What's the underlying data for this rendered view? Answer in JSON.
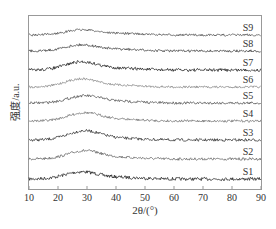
{
  "chart_data": {
    "type": "line",
    "title": "",
    "xlabel": "2θ/(°)",
    "ylabel": "强度/a.u.",
    "xlim": [
      10,
      90
    ],
    "xticks": [
      10,
      20,
      30,
      40,
      50,
      60,
      70,
      80,
      90
    ],
    "grid": false,
    "legend_position": "inline-right",
    "series": [
      {
        "name": "S1",
        "baseline_y": 179,
        "peak_x": 28,
        "peak_height": 7,
        "noise": 1.6,
        "color": "#222222"
      },
      {
        "name": "S2",
        "baseline_y": 159,
        "peak_x": 29,
        "peak_height": 8,
        "noise": 1.3,
        "color": "#666666"
      },
      {
        "name": "S3",
        "baseline_y": 140,
        "peak_x": 29,
        "peak_height": 9,
        "noise": 1.4,
        "color": "#333333"
      },
      {
        "name": "S4",
        "baseline_y": 121,
        "peak_x": 29,
        "peak_height": 8,
        "noise": 1.2,
        "color": "#777777"
      },
      {
        "name": "S5",
        "baseline_y": 103,
        "peak_x": 29,
        "peak_height": 7,
        "noise": 1.3,
        "color": "#555555"
      },
      {
        "name": "S6",
        "baseline_y": 87,
        "peak_x": 28,
        "peak_height": 8,
        "noise": 1.1,
        "color": "#888888"
      },
      {
        "name": "S7",
        "baseline_y": 70,
        "peak_x": 28,
        "peak_height": 8,
        "noise": 1.5,
        "color": "#222222"
      },
      {
        "name": "S8",
        "baseline_y": 51,
        "peak_x": 28,
        "peak_height": 6,
        "noise": 1.2,
        "color": "#444444"
      },
      {
        "name": "S9",
        "baseline_y": 35,
        "peak_x": 28,
        "peak_height": 5,
        "noise": 1.1,
        "color": "#555555"
      }
    ]
  },
  "axes": {
    "xlabel": "2θ/(°)",
    "ylabel": "强度/a.u.",
    "xtick_labels": [
      "10",
      "20",
      "30",
      "40",
      "50",
      "60",
      "70",
      "80",
      "90"
    ]
  }
}
